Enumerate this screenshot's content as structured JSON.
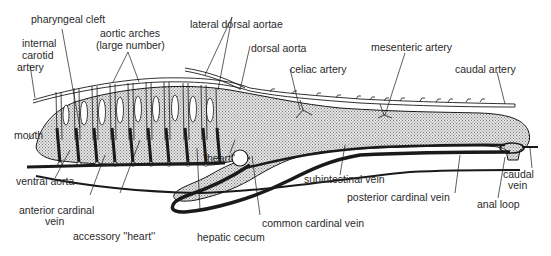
{
  "diagram": {
    "colors": {
      "line": "#1a1a1a",
      "stipple": "#b8b8b8",
      "background": "#ffffff"
    },
    "labels": {
      "pharyngeal_cleft": "pharyngeal cleft",
      "aortic_arches_1": "aortic arches",
      "aortic_arches_2": "(large number)",
      "internal_carotid_1": "internal",
      "internal_carotid_2": "carotid",
      "internal_carotid_3": "artery",
      "lateral_dorsal_aortae": "lateral dorsal aortae",
      "dorsal_aorta": "dorsal aorta",
      "celiac_artery": "celiac artery",
      "mesenteric_artery": "mesenteric artery",
      "caudal_artery": "caudal artery",
      "mouth": "mouth",
      "heart": "''heart''",
      "ventral_aorta": "ventral aorta",
      "anterior_cardinal_1": "anterior cardinal",
      "anterior_cardinal_2": "vein",
      "accessory_heart": "accessory ''heart''",
      "hepatic_cecum": "hepatic cecum",
      "common_cardinal_vein": "common cardinal vein",
      "subintestinal_vein": "subintestinal vein",
      "posterior_cardinal_vein": "posterior cardinal vein",
      "caudal_vein_1": "caudal",
      "caudal_vein_2": "vein",
      "anal_loop": "anal loop"
    }
  }
}
